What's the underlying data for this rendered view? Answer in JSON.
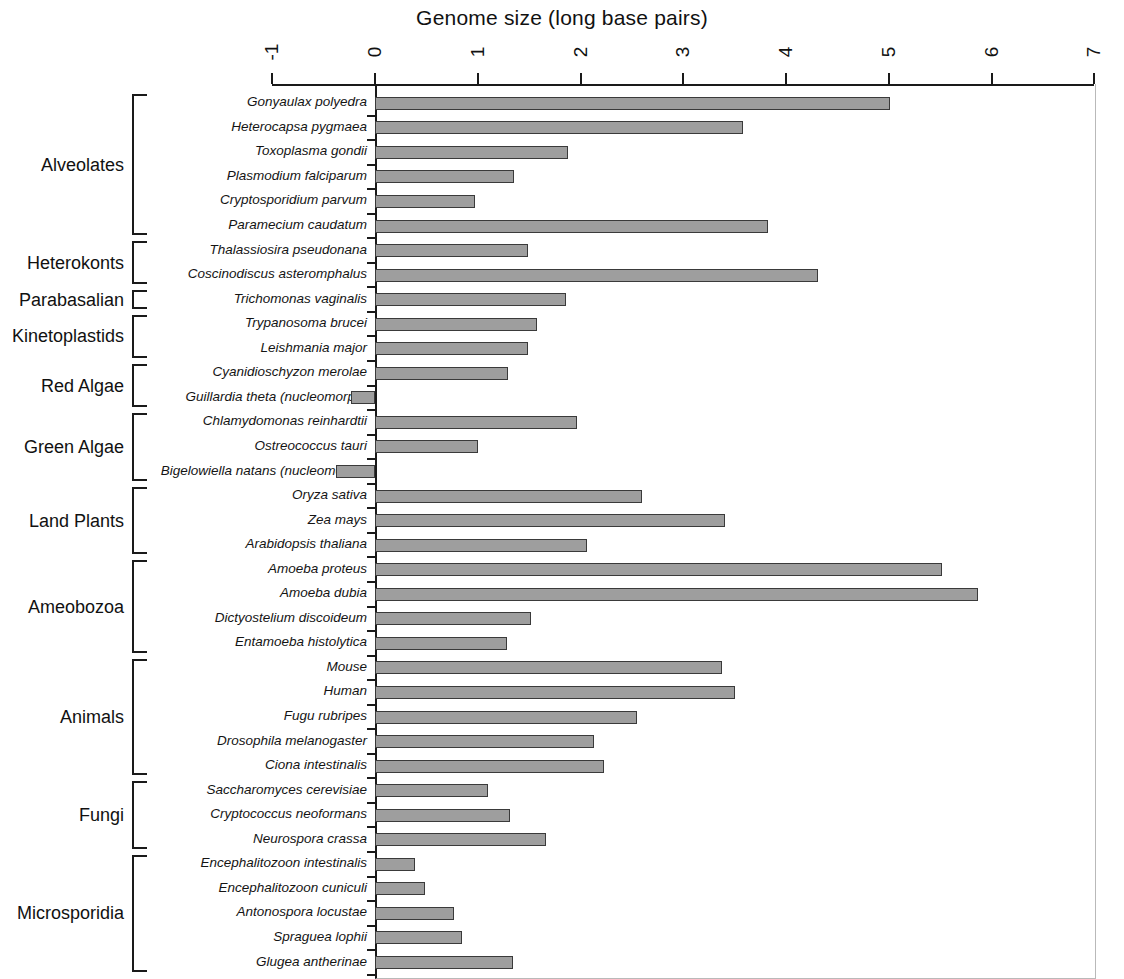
{
  "chart_data": {
    "type": "bar",
    "orientation": "horizontal",
    "title": "Genome size (long base pairs)",
    "xlabel": "Genome size (long base pairs)",
    "ylabel": "",
    "xlim": [
      -1,
      7
    ],
    "xticks": [
      "-1",
      "0",
      "1",
      "2",
      "3",
      "4",
      "5",
      "6",
      "7"
    ],
    "grid": false,
    "legend": null,
    "bar_color": "#9e9e9e",
    "bar_edge_color": "#3a3a3a",
    "categories": [
      "Gonyaulax polyedra",
      "Heterocapsa pygmaea",
      "Toxoplasma gondii",
      "Plasmodium falciparum",
      "Cryptosporidium parvum",
      "Paramecium caudatum",
      "Thalassiosira pseudonana",
      "Coscinodiscus asteromphalus",
      "Trichomonas vaginalis",
      "Trypanosoma brucei",
      "Leishmania major",
      "Cyanidioschyzon merolae",
      "Guillardia theta (nucleomorph)",
      "Chlamydomonas reinhardtii",
      "Ostreococcus tauri",
      "Bigelowiella natans (nucleomorph)",
      "Oryza sativa",
      "Zea mays",
      "Arabidopsis thaliana",
      "Amoeba proteus",
      "Amoeba dubia",
      "Dictyostelium discoideum",
      "Entamoeba histolytica",
      "Mouse",
      "Human",
      "Fugu rubripes",
      "Drosophila melanogaster",
      "Ciona intestinalis",
      "Saccharomyces cerevisiae",
      "Cryptococcus neoformans",
      "Neurospora crassa",
      "Encephalitozoon intestinalis",
      "Encephalitozoon cuniculi",
      "Antonospora locustae",
      "Spraguea lophii",
      "Glugea antherinae"
    ],
    "values": [
      5.01,
      3.58,
      1.88,
      1.35,
      0.97,
      3.82,
      1.49,
      4.31,
      1.86,
      1.58,
      1.49,
      1.29,
      -0.23,
      1.97,
      1.0,
      -0.38,
      2.6,
      3.41,
      2.06,
      5.52,
      5.87,
      1.52,
      1.28,
      3.38,
      3.5,
      2.55,
      2.13,
      2.23,
      1.1,
      1.31,
      1.66,
      0.39,
      0.49,
      0.77,
      0.85,
      1.34
    ],
    "groups": [
      {
        "label": "Alveolates",
        "start": 0,
        "end": 5
      },
      {
        "label": "Heterokonts",
        "start": 6,
        "end": 7
      },
      {
        "label": "Parabasalian",
        "start": 8,
        "end": 8
      },
      {
        "label": "Kinetoplastids",
        "start": 9,
        "end": 10
      },
      {
        "label": "Red Algae",
        "start": 11,
        "end": 12
      },
      {
        "label": "Green Algae",
        "start": 13,
        "end": 15
      },
      {
        "label": "Land Plants",
        "start": 16,
        "end": 18
      },
      {
        "label": "Ameobozoa",
        "start": 19,
        "end": 22
      },
      {
        "label": "Animals",
        "start": 23,
        "end": 27
      },
      {
        "label": "Fungi",
        "start": 28,
        "end": 30
      },
      {
        "label": "Microsporidia",
        "start": 31,
        "end": 35
      }
    ]
  }
}
